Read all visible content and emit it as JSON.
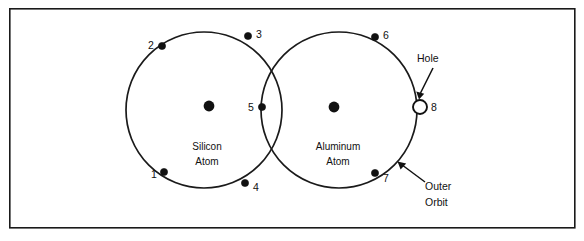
{
  "figure": {
    "frame": {
      "x": 9,
      "y": 8,
      "width": 566,
      "height": 220,
      "color": "#1a1a1a"
    },
    "background_color": "#ffffff",
    "line_color": "#111111"
  },
  "atoms": [
    {
      "id": "silicon-atom",
      "label_line1": "Silicon",
      "label_line2": "Atom",
      "label_x": 207,
      "label_y1": 150,
      "label_y2": 165,
      "orbit": {
        "cx": 204,
        "cy": 110,
        "r": 78
      },
      "nucleus": {
        "cx": 209,
        "cy": 106,
        "r": 5.4
      }
    },
    {
      "id": "aluminum-atom",
      "label_line1": "Aluminum",
      "label_line2": "Atom",
      "label_x": 338,
      "label_y1": 150,
      "label_y2": 165,
      "orbit": {
        "cx": 339,
        "cy": 110,
        "r": 78
      },
      "nucleus": {
        "cx": 334,
        "cy": 107,
        "r": 5.4
      }
    }
  ],
  "electrons": [
    {
      "label": "1",
      "cx": 164,
      "cy": 172,
      "r": 3.6,
      "label_x": 154,
      "label_y": 178
    },
    {
      "label": "2",
      "cx": 162,
      "cy": 46,
      "r": 3.6,
      "label_x": 151,
      "label_y": 45
    },
    {
      "label": "3",
      "cx": 248,
      "cy": 36,
      "r": 3.6,
      "label_x": 256,
      "label_y": 35
    },
    {
      "label": "4",
      "cx": 245,
      "cy": 183,
      "r": 3.6,
      "label_x": 253,
      "label_y": 190
    },
    {
      "label": "5",
      "cx": 262,
      "cy": 107,
      "r": 3.6,
      "label_x": 249,
      "label_y": 110
    },
    {
      "label": "6",
      "cx": 375,
      "cy": 37,
      "r": 3.6,
      "label_x": 383,
      "label_y": 35
    },
    {
      "label": "7",
      "cx": 375,
      "cy": 173,
      "r": 3.6,
      "label_x": 383,
      "label_y": 181
    }
  ],
  "hole": {
    "label": "8",
    "cx": 420,
    "cy": 107,
    "r": 7,
    "label_x": 432,
    "label_y": 111
  },
  "annotations": [
    {
      "id": "hole-annotation",
      "text": "Hole",
      "text_x": 417,
      "text_y": 62,
      "leader": {
        "x1": 433,
        "y1": 68,
        "x2": 420,
        "y2": 95
      },
      "arrow_tip": {
        "x": 419,
        "y": 98
      }
    },
    {
      "id": "outer-orbit-annotation",
      "text_line1": "Outer",
      "text_line2": "Orbit",
      "text_x": 425,
      "text_y1": 190,
      "text_y2": 206,
      "leader": {
        "x1": 424,
        "y1": 182,
        "x2": 400,
        "y2": 164
      },
      "arrow_tip": {
        "x": 397,
        "y": 161
      }
    }
  ]
}
